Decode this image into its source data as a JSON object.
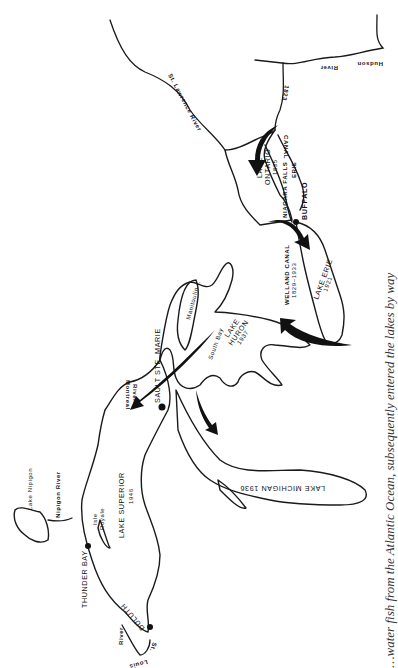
{
  "map": {
    "orientation": "rotated 90 degrees clockwise",
    "labels": {
      "st_lawrence": "St. Lawrence River",
      "hudson": "Hudson",
      "hudson_river": "River",
      "erie_canal_year": "1823",
      "lake_ontario": "LAKE",
      "lake_ontario_2": "ONTARIO",
      "lake_ontario_year": "1835",
      "niagara_falls": "NIAGARA FALLS",
      "erie_canal_1": "ERIE",
      "erie_canal_2": "CANAL",
      "buffalo": "BUFFALO",
      "welland_canal": "WELLAND CANAL",
      "welland_years": "1829–1933",
      "lake_erie": "LAKE ERIE",
      "lake_erie_year": "1921",
      "lake_huron": "LAKE",
      "lake_huron_2": "HURON",
      "lake_huron_year": "1937",
      "manitoulin": "Manitoulin I.",
      "south_bay": "South Bay",
      "sault_ste_marie": "SAULT STE. MARIE",
      "montreal_river_1": "Montreal",
      "montreal_river_2": "River",
      "lake_michigan": "LAKE MICHIGAN 1936",
      "lake_superior": "LAKE SUPERIOR",
      "lake_superior_year": "1946",
      "isle_royale_1": "Isle",
      "isle_royale_2": "Royale",
      "lake_nipigon": "Lake Nipigon",
      "nipigon_river": "Nipigon River",
      "thunder_bay": "THUNDER BAY",
      "duluth": "DULUTH",
      "st_louis_1": "St.",
      "st_louis_2": "Louis",
      "st_louis_3": "River"
    }
  },
  "caption": {
    "text": "…water fish from the Atlantic Ocean, subsequently entered the lakes by way"
  }
}
